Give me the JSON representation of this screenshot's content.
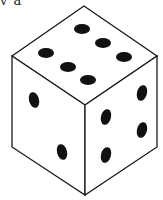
{
  "caption": "v a",
  "colors": {
    "background": "#ffffff",
    "stroke": "#1a1a1a",
    "pip": "#111111",
    "face": "#ffffff"
  },
  "die": {
    "vertices": {
      "top": [
        84,
        6
      ],
      "left": [
        12,
        56
      ],
      "right": [
        157,
        56
      ],
      "center": [
        85,
        105
      ],
      "bottom_left": [
        12,
        147
      ],
      "bottom_right": [
        157,
        147
      ],
      "bottom": [
        85,
        195
      ]
    },
    "faces": [
      {
        "name": "top",
        "pip_count": 6,
        "pips": [
          [
            82,
            29
          ],
          [
            103,
            43
          ],
          [
            124,
            57
          ],
          [
            46,
            53
          ],
          [
            68,
            67
          ],
          [
            88,
            80
          ]
        ],
        "rx": 8,
        "ry": 5,
        "rotate": 0
      },
      {
        "name": "left",
        "pip_count": 2,
        "pips": [
          [
            34,
            100
          ],
          [
            62,
            152
          ]
        ],
        "rx": 5,
        "ry": 8,
        "rotate": -15
      },
      {
        "name": "right",
        "pip_count": 4,
        "pips": [
          [
            106,
            117
          ],
          [
            142,
            93
          ],
          [
            106,
            155
          ],
          [
            142,
            130
          ]
        ],
        "rx": 5,
        "ry": 8,
        "rotate": 15
      }
    ]
  }
}
